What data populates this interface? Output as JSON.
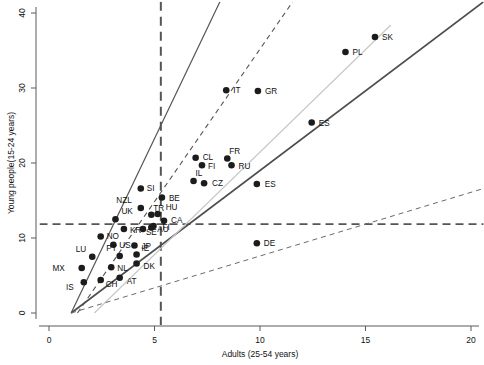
{
  "chart_data": {
    "type": "scatter",
    "title": "",
    "xlabel": "Adults (25-54 years)",
    "ylabel": "Young people(15-24 years)",
    "xlim": [
      -0.45,
      20.6
    ],
    "ylim": [
      -1.6,
      41.5
    ],
    "xticks": [
      0,
      5,
      10,
      15,
      20
    ],
    "yticks": [
      0,
      10,
      20,
      30,
      40
    ],
    "xtick_labels": [
      "0",
      "5",
      "10",
      "15",
      "20"
    ],
    "ytick_labels": [
      "0",
      "10",
      "20",
      "30",
      "40"
    ],
    "grid": false,
    "legend": "none",
    "points": [
      {
        "label": "IS",
        "x": 1.65,
        "y": 4.1,
        "lx": -10,
        "ly": 8
      },
      {
        "label": "MX",
        "x": 1.55,
        "y": 6.0,
        "lx": -17,
        "ly": 3
      },
      {
        "label": "LU",
        "x": 2.05,
        "y": 7.5,
        "lx": -6,
        "ly": -5
      },
      {
        "label": "CH",
        "x": 2.45,
        "y": 4.4,
        "lx": 5,
        "ly": 7
      },
      {
        "label": "NL",
        "x": 2.95,
        "y": 6.1,
        "lx": 6,
        "ly": 4
      },
      {
        "label": "AT",
        "x": 3.35,
        "y": 4.7,
        "lx": 7,
        "ly": 6
      },
      {
        "label": "NO",
        "x": 2.45,
        "y": 10.2,
        "lx": 6,
        "ly": 2
      },
      {
        "label": "US",
        "x": 3.05,
        "y": 9.1,
        "lx": 6,
        "ly": 3
      },
      {
        "label": "PT",
        "x": 3.35,
        "y": 7.6,
        "lx": -3,
        "ly": -5
      },
      {
        "label": "IE",
        "x": 4.15,
        "y": 7.8,
        "lx": 5,
        "ly": -4
      },
      {
        "label": "DK",
        "x": 4.15,
        "y": 6.6,
        "lx": 7,
        "ly": 5
      },
      {
        "label": "JP",
        "x": 4.05,
        "y": 9.0,
        "lx": 7,
        "ly": 3
      },
      {
        "label": "KR",
        "x": 3.55,
        "y": 11.2,
        "lx": 6,
        "ly": 4
      },
      {
        "label": "UK",
        "x": 3.15,
        "y": 12.5,
        "lx": 0,
        "ly": -5
      },
      {
        "label": "SE",
        "x": 4.45,
        "y": 11.2,
        "lx": 3,
        "ly": 6
      },
      {
        "label": "AU",
        "x": 4.85,
        "y": 11.4,
        "lx": 6,
        "ly": 4
      },
      {
        "label": "FI",
        "x": 4.95,
        "y": 11.6,
        "lx": 9,
        "ly": 4
      },
      {
        "label": "NZL",
        "x": 4.35,
        "y": 14.0,
        "lx": -9,
        "ly": -5
      },
      {
        "label": "TR",
        "x": 4.85,
        "y": 13.1,
        "lx": 2,
        "ly": -4
      },
      {
        "label": "HU",
        "x": 5.15,
        "y": 13.2,
        "lx": 8,
        "ly": -4
      },
      {
        "label": "CA",
        "x": 5.45,
        "y": 12.3,
        "lx": 7,
        "ly": 2
      },
      {
        "label": "SI",
        "x": 4.35,
        "y": 16.6,
        "lx": 6,
        "ly": 2
      },
      {
        "label": "BE",
        "x": 5.35,
        "y": 15.4,
        "lx": 7,
        "ly": 3
      },
      {
        "label": "IL",
        "x": 6.85,
        "y": 17.6,
        "lx": 2,
        "ly": -5
      },
      {
        "label": "CZ",
        "x": 7.35,
        "y": 17.3,
        "lx": 8,
        "ly": 3
      },
      {
        "label": "CL",
        "x": 6.95,
        "y": 20.7,
        "lx": 7,
        "ly": 2
      },
      {
        "label": "FI2",
        "x": 7.25,
        "y": 19.7,
        "lx": 6,
        "ly": 4
      },
      {
        "label": "FR",
        "x": 8.45,
        "y": 20.6,
        "lx": 2,
        "ly": -5
      },
      {
        "label": "RU",
        "x": 8.65,
        "y": 19.7,
        "lx": 7,
        "ly": 4
      },
      {
        "label": "ES",
        "x": 9.85,
        "y": 17.2,
        "lx": 8,
        "ly": 3
      },
      {
        "label": "IT",
        "x": 8.4,
        "y": 29.7,
        "lx": 7,
        "ly": 3
      },
      {
        "label": "GR",
        "x": 9.9,
        "y": 29.6,
        "lx": 7,
        "ly": 3
      },
      {
        "label": "DE",
        "x": 9.85,
        "y": 9.3,
        "lx": 7,
        "ly": 3
      },
      {
        "label": "ES2",
        "x": 12.45,
        "y": 25.4,
        "lx": 7,
        "ly": 3
      },
      {
        "label": "PL",
        "x": 14.05,
        "y": 34.8,
        "lx": 7,
        "ly": 3
      },
      {
        "label": "SK",
        "x": 15.45,
        "y": 36.8,
        "lx": 7,
        "ly": 3
      }
    ],
    "point_display_labels": {
      "FI2": "FI",
      "ES2": "ES"
    },
    "reference_lines": [
      {
        "name": "vertical-threshold",
        "type": "vertical",
        "x": 5.3,
        "style": "dashed",
        "color": "#555555",
        "width": 2.0
      },
      {
        "name": "horizontal-threshold",
        "type": "horizontal",
        "y": 11.85,
        "style": "dashed",
        "color": "#555555",
        "width": 1.6
      },
      {
        "name": "ratio-line-steep-solid",
        "type": "ray",
        "x1": 1.05,
        "y1": 0.0,
        "x2": 8.1,
        "y2": 41.5,
        "style": "solid",
        "color": "#555555",
        "width": 1.2
      },
      {
        "name": "ratio-line-steep-dashed",
        "type": "ray",
        "x1": 1.35,
        "y1": 0.0,
        "x2": 11.55,
        "y2": 41.5,
        "style": "dashed",
        "color": "#555555",
        "width": 1.1
      },
      {
        "name": "ratio-line-mid-solid",
        "type": "ray",
        "x1": 1.05,
        "y1": 0.0,
        "x2": 20.6,
        "y2": 41.5,
        "style": "solid",
        "color": "#4d4d4d",
        "width": 1.6
      },
      {
        "name": "ratio-line-light",
        "type": "ray",
        "x1": 2.15,
        "y1": 0.0,
        "x2": 16.2,
        "y2": 38.4,
        "style": "solid",
        "color": "#c8c8c8",
        "width": 1.2
      },
      {
        "name": "ratio-line-shallow-dashed",
        "type": "ray",
        "x1": 1.05,
        "y1": 0.0,
        "x2": 20.6,
        "y2": 16.6,
        "style": "dashed",
        "color": "#6a6a6a",
        "width": 1.0
      }
    ]
  },
  "axes": {
    "x_title": "Adults (25-54 years)",
    "y_title": "Young people(15-24 years)"
  }
}
